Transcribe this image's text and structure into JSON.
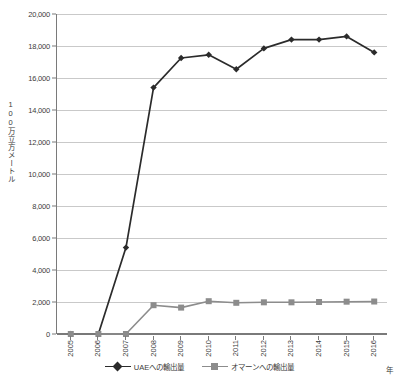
{
  "chart_data": {
    "type": "line",
    "title": "",
    "xlabel": "年",
    "ylabel": "100万立方メートル",
    "x": [
      "2005",
      "2006",
      "2007",
      "2008",
      "2009",
      "2010",
      "2011",
      "2012",
      "2013",
      "2014",
      "2015",
      "2016"
    ],
    "categories": [
      "2005",
      "2006",
      "2007",
      "2008",
      "2009",
      "2010",
      "2011",
      "2012",
      "2013",
      "2014",
      "2015",
      "2016"
    ],
    "ylim": [
      0,
      20000
    ],
    "ytick_step": 2000,
    "yticks": [
      "0",
      "2,000",
      "4,000",
      "6,000",
      "8,000",
      "10,000",
      "12,000",
      "14,000",
      "16,000",
      "18,000",
      "20,000"
    ],
    "ytick_values": [
      0,
      2000,
      4000,
      6000,
      8000,
      10000,
      12000,
      14000,
      16000,
      18000,
      20000
    ],
    "grid": true,
    "legend_position": "bottom",
    "series": [
      {
        "name": "UAEへの輸出量",
        "color": "#2b2b2b",
        "marker": "diamond",
        "values": [
          0,
          0,
          5400,
          15400,
          17250,
          17450,
          16550,
          17850,
          18400,
          18400,
          18600,
          17600
        ]
      },
      {
        "name": "オマーンへの輸出量",
        "color": "#8c8c8c",
        "marker": "square",
        "values": [
          0,
          0,
          0,
          1800,
          1650,
          2050,
          1950,
          1980,
          1980,
          2000,
          2020,
          2030
        ]
      }
    ]
  },
  "axis": {
    "y_title": "100万立方メートル",
    "x_title": "年"
  }
}
